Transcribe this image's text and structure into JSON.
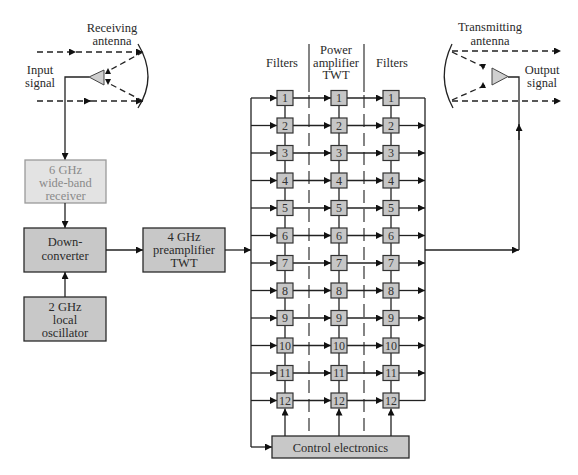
{
  "diagram": {
    "receiving_antenna": {
      "lines": [
        "Receiving",
        "antenna"
      ]
    },
    "input_signal": {
      "lines": [
        "Input",
        "signal"
      ]
    },
    "receiver": {
      "lines": [
        "6 GHz",
        "wide-band",
        "receiver"
      ]
    },
    "downconverter": {
      "lines": [
        "Down-",
        "converter"
      ]
    },
    "local_oscillator": {
      "lines": [
        "2 GHz",
        "local",
        "oscillator"
      ]
    },
    "preamplifier": {
      "lines": [
        "4 GHz",
        "preamplifier",
        "TWT"
      ]
    },
    "column_headers": [
      {
        "lines": [
          "Filters"
        ]
      },
      {
        "lines": [
          "Power",
          "amplifier",
          "TWT"
        ]
      },
      {
        "lines": [
          "Filters"
        ]
      }
    ],
    "channels": [
      "1",
      "2",
      "3",
      "4",
      "5",
      "6",
      "7",
      "8",
      "9",
      "10",
      "11",
      "12"
    ],
    "control_electronics": "Control electronics",
    "transmitting_antenna": {
      "lines": [
        "Transmitting",
        "antenna"
      ]
    },
    "output_signal": {
      "lines": [
        "Output",
        "signal"
      ]
    }
  },
  "colors": {
    "block_fill": "#c8c8c8",
    "receiver_fill": "#e3e3e3",
    "receiver_text": "#8a8a8a",
    "line": "#222222"
  }
}
